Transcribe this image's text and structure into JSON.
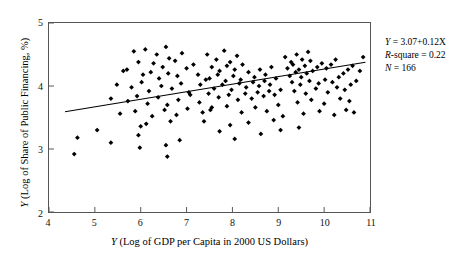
{
  "chart_data": {
    "type": "scatter",
    "title": "",
    "xlabel": "X (Log of GDP per Capita in 2000 US Dollars)",
    "ylabel": "Y (Log of Share of Public Financing, %)",
    "xlim": [
      4,
      11
    ],
    "ylim": [
      2,
      5
    ],
    "xticks": [
      4,
      5,
      6,
      7,
      8,
      9,
      10,
      11
    ],
    "yticks": [
      2,
      3,
      4,
      5
    ],
    "grid": false,
    "legend": null,
    "marker": "diamond",
    "marker_color": "#000000",
    "n_points": 166,
    "fit_line": {
      "type": "linear",
      "intercept": 3.07,
      "slope": 0.12,
      "x_start": 4.35,
      "x_end": 10.9,
      "color": "#000000"
    },
    "annotations": {
      "equation_var": "Y",
      "equation_rest": " = 3.07+0.12X",
      "rsquare_var": "R",
      "rsquare_rest": "-square = 0.22",
      "n_var": "N",
      "n_rest": " = 166"
    },
    "points": [
      [
        5.85,
        4.55
      ],
      [
        6.1,
        4.58
      ],
      [
        6.35,
        4.5
      ],
      [
        6.55,
        4.62
      ],
      [
        6.62,
        4.44
      ],
      [
        5.95,
        4.38
      ],
      [
        6.28,
        4.36
      ],
      [
        6.48,
        4.3
      ],
      [
        6.75,
        4.4
      ],
      [
        6.9,
        4.52
      ],
      [
        5.62,
        4.24
      ],
      [
        5.7,
        4.26
      ],
      [
        6.05,
        4.18
      ],
      [
        6.22,
        4.22
      ],
      [
        6.4,
        4.12
      ],
      [
        6.6,
        4.2
      ],
      [
        6.8,
        4.16
      ],
      [
        7.0,
        4.28
      ],
      [
        7.15,
        4.34
      ],
      [
        7.25,
        4.18
      ],
      [
        5.48,
        4.02
      ],
      [
        5.8,
        3.98
      ],
      [
        6.02,
        4.06
      ],
      [
        6.18,
        3.92
      ],
      [
        6.45,
        4.0
      ],
      [
        6.68,
        3.96
      ],
      [
        6.88,
        4.04
      ],
      [
        7.05,
        3.9
      ],
      [
        7.3,
        4.02
      ],
      [
        7.42,
        4.1
      ],
      [
        5.35,
        3.8
      ],
      [
        5.72,
        3.76
      ],
      [
        5.92,
        3.84
      ],
      [
        6.15,
        3.72
      ],
      [
        6.38,
        3.82
      ],
      [
        6.58,
        3.7
      ],
      [
        6.82,
        3.78
      ],
      [
        7.08,
        3.86
      ],
      [
        7.28,
        3.74
      ],
      [
        7.48,
        3.88
      ],
      [
        5.55,
        3.56
      ],
      [
        5.88,
        3.6
      ],
      [
        6.25,
        3.52
      ],
      [
        6.52,
        3.62
      ],
      [
        6.78,
        3.54
      ],
      [
        7.02,
        3.64
      ],
      [
        7.35,
        3.58
      ],
      [
        7.55,
        3.66
      ],
      [
        6.12,
        3.4
      ],
      [
        6.65,
        3.44
      ],
      [
        4.62,
        3.18
      ],
      [
        4.55,
        2.92
      ],
      [
        5.05,
        3.3
      ],
      [
        5.35,
        3.1
      ],
      [
        5.95,
        3.22
      ],
      [
        5.98,
        3.02
      ],
      [
        6.0,
        3.36
      ],
      [
        6.55,
        3.06
      ],
      [
        6.58,
        2.88
      ],
      [
        6.85,
        3.14
      ],
      [
        7.45,
        4.5
      ],
      [
        7.65,
        4.42
      ],
      [
        7.82,
        4.56
      ],
      [
        7.95,
        4.38
      ],
      [
        8.1,
        4.48
      ],
      [
        7.55,
        4.3
      ],
      [
        7.72,
        4.24
      ],
      [
        7.88,
        4.32
      ],
      [
        8.05,
        4.26
      ],
      [
        8.22,
        4.34
      ],
      [
        7.5,
        4.12
      ],
      [
        7.68,
        4.18
      ],
      [
        7.85,
        4.08
      ],
      [
        8.02,
        4.16
      ],
      [
        8.18,
        4.1
      ],
      [
        8.35,
        4.22
      ],
      [
        8.48,
        4.14
      ],
      [
        8.6,
        4.26
      ],
      [
        8.72,
        4.18
      ],
      [
        8.85,
        4.3
      ],
      [
        7.6,
        3.96
      ],
      [
        7.78,
        4.02
      ],
      [
        7.98,
        3.94
      ],
      [
        8.15,
        4.04
      ],
      [
        8.3,
        3.98
      ],
      [
        8.45,
        4.06
      ],
      [
        8.58,
        4.0
      ],
      [
        8.7,
        4.08
      ],
      [
        8.82,
        4.02
      ],
      [
        8.95,
        4.12
      ],
      [
        7.7,
        3.82
      ],
      [
        7.92,
        3.86
      ],
      [
        8.12,
        3.78
      ],
      [
        8.28,
        3.88
      ],
      [
        8.42,
        3.8
      ],
      [
        8.55,
        3.9
      ],
      [
        8.68,
        3.84
      ],
      [
        8.8,
        3.92
      ],
      [
        8.92,
        3.86
      ],
      [
        9.05,
        3.94
      ],
      [
        7.52,
        3.62
      ],
      [
        7.88,
        3.68
      ],
      [
        8.2,
        3.58
      ],
      [
        8.5,
        3.66
      ],
      [
        8.75,
        3.6
      ],
      [
        9.0,
        3.7
      ],
      [
        8.35,
        3.42
      ],
      [
        8.9,
        3.46
      ],
      [
        7.95,
        3.38
      ],
      [
        9.1,
        3.52
      ],
      [
        9.15,
        4.46
      ],
      [
        9.28,
        4.38
      ],
      [
        9.4,
        4.5
      ],
      [
        9.52,
        4.42
      ],
      [
        9.65,
        4.54
      ],
      [
        9.2,
        4.28
      ],
      [
        9.32,
        4.34
      ],
      [
        9.45,
        4.26
      ],
      [
        9.58,
        4.32
      ],
      [
        9.7,
        4.4
      ],
      [
        9.25,
        4.16
      ],
      [
        9.38,
        4.22
      ],
      [
        9.5,
        4.14
      ],
      [
        9.62,
        4.2
      ],
      [
        9.75,
        4.24
      ],
      [
        9.85,
        4.3
      ],
      [
        9.95,
        4.36
      ],
      [
        10.05,
        4.28
      ],
      [
        10.15,
        4.34
      ],
      [
        10.25,
        4.42
      ],
      [
        9.3,
        4.06
      ],
      [
        9.48,
        4.02
      ],
      [
        9.68,
        4.08
      ],
      [
        9.88,
        4.04
      ],
      [
        10.02,
        4.1
      ],
      [
        10.18,
        4.06
      ],
      [
        10.32,
        4.14
      ],
      [
        10.42,
        4.2
      ],
      [
        10.52,
        4.26
      ],
      [
        10.62,
        4.32
      ],
      [
        9.35,
        3.92
      ],
      [
        9.6,
        3.88
      ],
      [
        9.82,
        3.96
      ],
      [
        10.08,
        3.9
      ],
      [
        10.28,
        3.98
      ],
      [
        10.45,
        3.94
      ],
      [
        10.58,
        4.02
      ],
      [
        10.7,
        4.08
      ],
      [
        10.78,
        4.24
      ],
      [
        10.85,
        4.46
      ],
      [
        9.42,
        3.74
      ],
      [
        9.72,
        3.78
      ],
      [
        10.0,
        3.72
      ],
      [
        10.35,
        3.8
      ],
      [
        10.55,
        3.76
      ],
      [
        9.55,
        3.56
      ],
      [
        9.9,
        3.6
      ],
      [
        10.22,
        3.54
      ],
      [
        10.48,
        3.62
      ],
      [
        10.65,
        3.58
      ],
      [
        9.05,
        3.3
      ],
      [
        9.45,
        3.34
      ],
      [
        8.62,
        3.24
      ],
      [
        7.72,
        3.28
      ],
      [
        8.05,
        3.16
      ],
      [
        7.38,
        3.44
      ]
    ]
  }
}
